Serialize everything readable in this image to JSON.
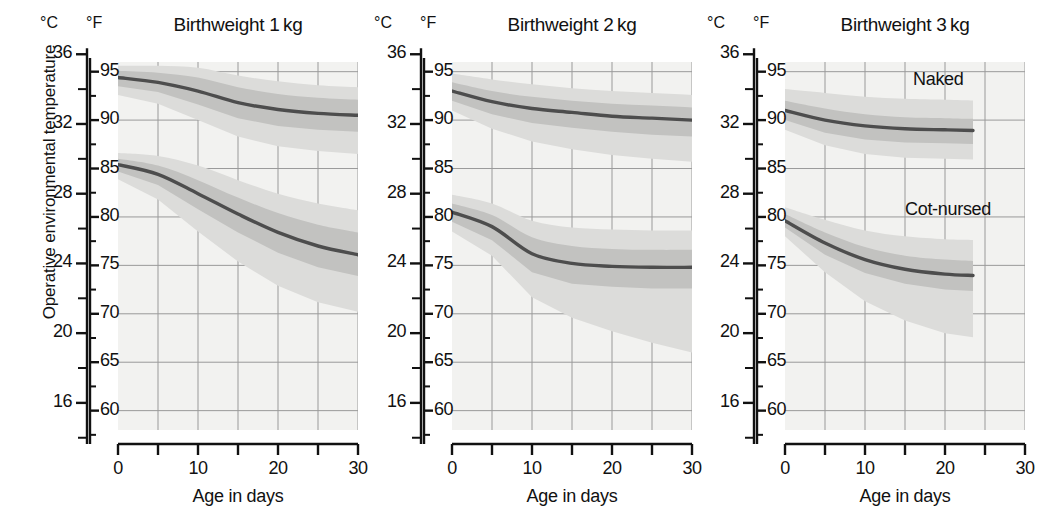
{
  "figure": {
    "ylabel": "Operative environmental temperature",
    "xlabel": "Age in days",
    "unit_c": "°C",
    "unit_f": "°F",
    "curve_color": "#4d4d4d",
    "band_outer_color": "#dcdcda",
    "band_inner_color": "#c2c2c0",
    "plot_bg": "#f2f2f0",
    "grid_color": "#9a9a9a"
  },
  "axes": {
    "c_ticks_major": [
      36,
      32,
      28,
      24,
      20,
      16
    ],
    "c_ticks_minor": [
      34,
      30,
      26,
      22,
      18,
      14
    ],
    "f_ticks": [
      95,
      90,
      85,
      80,
      75,
      70,
      65,
      60
    ],
    "f_range": [
      58,
      96
    ],
    "x_ticks": [
      0,
      5,
      10,
      15,
      20,
      25,
      30
    ],
    "x_tick_labels": [
      "0",
      "",
      "10",
      "",
      "20",
      "",
      "30"
    ],
    "x_range": [
      0,
      30
    ]
  },
  "chart_data": {
    "type": "line",
    "xlabel": "Age in days",
    "ylabel": "Operative environmental temperature",
    "x": [
      0,
      5,
      10,
      15,
      20,
      25,
      30
    ],
    "xlim": [
      0,
      30
    ],
    "ylim_f": [
      58,
      96
    ],
    "ylim_c": [
      14.4,
      35.6
    ],
    "grid": true,
    "legend": "in-plot annotations on third panel",
    "panels": [
      {
        "title": "Birthweight 1 kg",
        "weight_kg": 1,
        "x_data_end": 30,
        "series": [
          {
            "name": "Naked",
            "values_f": [
              94.4,
              93.9,
              93.0,
              91.8,
              91.1,
              90.7,
              90.5
            ],
            "band_upper_f": [
              95.1,
              94.9,
              94.4,
              93.4,
              92.7,
              92.3,
              92.1
            ],
            "band_lower_f": [
              93.5,
              92.9,
              91.6,
              90.2,
              89.4,
              89.0,
              88.8
            ],
            "outer_upper_f": [
              95.6,
              95.6,
              95.4,
              94.6,
              94.0,
              93.6,
              93.4
            ],
            "outer_lower_f": [
              92.6,
              91.7,
              90.0,
              88.3,
              87.3,
              86.8,
              86.5
            ]
          },
          {
            "name": "Cot-nursed",
            "values_f": [
              85.4,
              84.4,
              82.4,
              80.3,
              78.4,
              77.0,
              76.1
            ],
            "band_upper_f": [
              86.0,
              85.3,
              83.8,
              82.0,
              80.4,
              79.2,
              78.4
            ],
            "band_lower_f": [
              84.7,
              83.3,
              80.8,
              78.4,
              76.3,
              74.8,
              73.9
            ],
            "outer_upper_f": [
              86.6,
              86.3,
              85.3,
              83.8,
              82.4,
              81.4,
              80.7
            ],
            "outer_lower_f": [
              83.9,
              81.8,
              78.5,
              75.4,
              72.9,
              71.2,
              70.2
            ]
          }
        ]
      },
      {
        "title": "Birthweight 2 kg",
        "weight_kg": 2,
        "x_data_end": 30,
        "series": [
          {
            "name": "Naked",
            "values_f": [
              93.0,
              91.9,
              91.2,
              90.8,
              90.4,
              90.2,
              90.0
            ],
            "band_upper_f": [
              93.9,
              93.0,
              92.4,
              92.0,
              91.7,
              91.5,
              91.3
            ],
            "band_lower_f": [
              92.0,
              90.6,
              89.7,
              89.2,
              88.8,
              88.5,
              88.3
            ],
            "outer_upper_f": [
              94.8,
              94.2,
              93.7,
              93.3,
              93.0,
              92.8,
              92.6
            ],
            "outer_lower_f": [
              91.0,
              89.1,
              87.8,
              87.0,
              86.4,
              86.0,
              85.7
            ]
          },
          {
            "name": "Cot-nursed",
            "values_f": [
              80.5,
              79.0,
              76.2,
              75.2,
              74.9,
              74.8,
              74.8
            ],
            "band_upper_f": [
              81.4,
              80.2,
              77.9,
              77.0,
              76.7,
              76.6,
              76.6
            ],
            "band_lower_f": [
              79.5,
              77.6,
              74.3,
              73.1,
              72.8,
              72.6,
              72.6
            ],
            "outer_upper_f": [
              82.3,
              81.4,
              79.6,
              78.9,
              78.7,
              78.6,
              78.6
            ],
            "outer_lower_f": [
              78.5,
              76.0,
              71.7,
              69.6,
              68.2,
              67.0,
              66.0
            ]
          }
        ]
      },
      {
        "title": "Birthweight 3 kg",
        "weight_kg": 3,
        "x_data_end": 23.5,
        "annotations": [
          {
            "text": "Naked",
            "x": 16,
            "y_f": 94.0
          },
          {
            "text": "Cot-nursed",
            "x": 15,
            "y_f": 80.6
          }
        ],
        "series": [
          {
            "name": "Naked",
            "values_f": [
              91.0,
              90.0,
              89.4,
              89.1,
              89.0,
              88.9,
              88.9
            ],
            "band_upper_f": [
              92.0,
              91.2,
              90.6,
              90.3,
              90.2,
              90.1,
              90.1
            ],
            "band_lower_f": [
              90.0,
              88.7,
              88.0,
              87.7,
              87.6,
              87.5,
              87.5
            ],
            "outer_upper_f": [
              93.2,
              92.8,
              92.4,
              92.2,
              92.1,
              92.0,
              92.0
            ],
            "outer_lower_f": [
              89.0,
              87.4,
              86.5,
              86.1,
              86.0,
              85.9,
              85.9
            ]
          },
          {
            "name": "Cot-nursed",
            "values_f": [
              79.6,
              77.3,
              75.6,
              74.6,
              74.1,
              73.9,
              73.9
            ],
            "band_upper_f": [
              80.3,
              78.4,
              76.9,
              76.0,
              75.6,
              75.4,
              75.4
            ],
            "band_lower_f": [
              78.9,
              76.1,
              74.2,
              73.1,
              72.5,
              72.3,
              72.3
            ],
            "outer_upper_f": [
              81.0,
              79.7,
              78.6,
              78.0,
              77.7,
              77.6,
              77.6
            ],
            "outer_lower_f": [
              78.0,
              74.3,
              71.3,
              69.3,
              68.0,
              67.4,
              67.4
            ]
          }
        ]
      }
    ]
  }
}
